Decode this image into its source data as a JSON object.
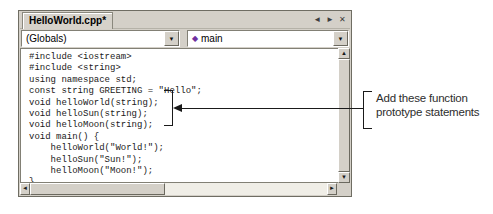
{
  "window": {
    "tab_label": "HelloWorld.cpp*",
    "nav": {
      "back_glyph": "◄",
      "forward_glyph": "►",
      "close_glyph": "✕"
    },
    "toolbar": {
      "scope_dropdown_value": "(Globals)",
      "member_dropdown_value": "main",
      "member_icon_glyph": "◆",
      "dropdown_arrow_glyph": "▼"
    },
    "editor": {
      "code_lines": [
        "#include <iostream>",
        "#include <string>",
        "using namespace std;",
        "const string GREETING = \"Hello\";",
        "void helloWorld(string);",
        "void helloSun(string);",
        "void helloMoon(string);",
        "void main() {",
        "    helloWorld(\"World!\");",
        "    helloSun(\"Sun!\");",
        "    helloMoon(\"Moon!\");",
        "}"
      ]
    },
    "scrollbars": {
      "up_glyph": "▲",
      "down_glyph": "▼",
      "left_glyph": "◄",
      "right_glyph": "►"
    }
  },
  "annotation": {
    "line1": "Add these function",
    "line2": "prototype statements"
  },
  "colors": {
    "chrome": "#d4d0c8",
    "code_background": "#ffffff",
    "callout_ink": "#1a1a1a",
    "member_icon": "#7030a0"
  }
}
